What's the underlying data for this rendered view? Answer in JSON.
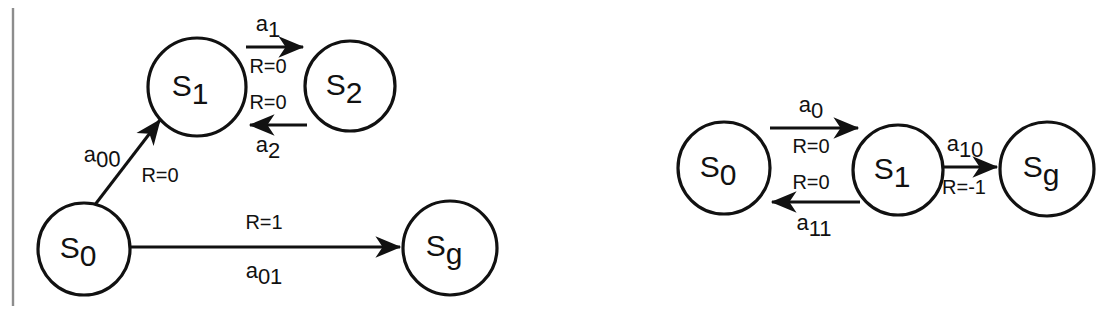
{
  "figure": {
    "background_color": "#ffffff",
    "stroke_color": "#111111",
    "margin_line_color": "#8d8d8d"
  },
  "diagrams": [
    {
      "id": "left-mdp",
      "name": "left-state-diagram",
      "nodes": [
        {
          "id": "s0",
          "label": "S",
          "sub": "0",
          "cx": 84,
          "cy": 249,
          "r": 46
        },
        {
          "id": "s1",
          "label": "S",
          "sub": "1",
          "cx": 197,
          "cy": 87,
          "r": 49
        },
        {
          "id": "s2",
          "label": "S",
          "sub": "2",
          "cx": 350,
          "cy": 86,
          "r": 45
        },
        {
          "id": "sg",
          "label": "S",
          "sub": "g",
          "cx": 450,
          "cy": 248,
          "r": 47
        }
      ],
      "edges": [
        {
          "id": "e-s1-s2",
          "from": "s1",
          "to": "s2",
          "action": "a",
          "action_sub": "1",
          "reward": "R=0"
        },
        {
          "id": "e-s2-s1",
          "from": "s2",
          "to": "s1",
          "action": "a",
          "action_sub": "2",
          "reward": "R=0"
        },
        {
          "id": "e-s0-s1",
          "from": "s0",
          "to": "s1",
          "action": "a",
          "action_sub": "00",
          "reward": "R=0"
        },
        {
          "id": "e-s0-sg",
          "from": "s0",
          "to": "sg",
          "action": "a",
          "action_sub": "01",
          "reward": "R=1"
        }
      ]
    },
    {
      "id": "right-mdp",
      "name": "right-state-diagram",
      "nodes": [
        {
          "id": "s0",
          "label": "S",
          "sub": "0",
          "cx": 724,
          "cy": 168,
          "r": 46
        },
        {
          "id": "s1",
          "label": "S",
          "sub": "1",
          "cx": 898,
          "cy": 170,
          "r": 45
        },
        {
          "id": "sg",
          "label": "S",
          "sub": "g",
          "cx": 1047,
          "cy": 169,
          "r": 47
        }
      ],
      "edges": [
        {
          "id": "e-s0-s1",
          "from": "s0",
          "to": "s1",
          "action": "a",
          "action_sub": "0",
          "reward": "R=0"
        },
        {
          "id": "e-s1-s0",
          "from": "s1",
          "to": "s0",
          "action": "a",
          "action_sub": "11",
          "reward": "R=0"
        },
        {
          "id": "e-s1-sg",
          "from": "s1",
          "to": "sg",
          "action": "a",
          "action_sub": "10",
          "reward": "R=-1"
        }
      ]
    }
  ],
  "labels": {
    "left": {
      "s0": "S",
      "s0_sub": "0",
      "s1": "S",
      "s1_sub": "1",
      "s2": "S",
      "s2_sub": "2",
      "sg": "S",
      "sg_sub": "g",
      "a1": "a",
      "a1_sub": "1",
      "a2": "a",
      "a2_sub": "2",
      "a00": "a",
      "a00_sub": "00",
      "a01": "a",
      "a01_sub": "01",
      "r_top": "R=0",
      "r_bottom": "R=0",
      "r_diag": "R=0",
      "r_goal": "R=1"
    },
    "right": {
      "s0": "S",
      "s0_sub": "0",
      "s1": "S",
      "s1_sub": "1",
      "sg": "S",
      "sg_sub": "g",
      "a0": "a",
      "a0_sub": "0",
      "a11": "a",
      "a11_sub": "11",
      "a10": "a",
      "a10_sub": "10",
      "r_top": "R=0",
      "r_bottom": "R=0",
      "r_goal": "R=-1"
    }
  }
}
